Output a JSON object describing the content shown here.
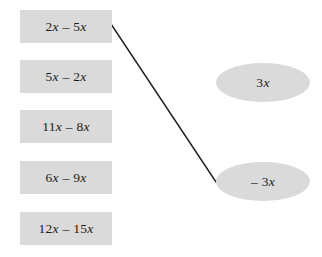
{
  "canvas": {
    "width": 322,
    "height": 257,
    "background": "#ffffff",
    "shape_fill": "#dadada",
    "text_color": "#1b1b1b",
    "line_color": "#1f1f1f"
  },
  "left_column": {
    "name": "expressions",
    "items": [
      {
        "text": "2x – 5x",
        "x": 20,
        "y": 10,
        "w": 92,
        "h": 33
      },
      {
        "text": "5x – 2x",
        "x": 20,
        "y": 60,
        "w": 92,
        "h": 33
      },
      {
        "text": "11x – 8x",
        "x": 20,
        "y": 110,
        "w": 92,
        "h": 33
      },
      {
        "text": "6x – 9x",
        "x": 20,
        "y": 161,
        "w": 92,
        "h": 33
      },
      {
        "text": "12x – 15x",
        "x": 20,
        "y": 212,
        "w": 92,
        "h": 33
      }
    ]
  },
  "right_column": {
    "name": "answers",
    "items": [
      {
        "text": "3x",
        "x": 216,
        "y": 63,
        "w": 94,
        "h": 39
      },
      {
        "text": "– 3x",
        "x": 216,
        "y": 162,
        "w": 94,
        "h": 39
      }
    ]
  },
  "connections": [
    {
      "from": "2x – 5x",
      "to": "– 3x",
      "x1": 111,
      "y1": 24,
      "x2": 216,
      "y2": 182,
      "stroke_width": 1.4
    }
  ]
}
